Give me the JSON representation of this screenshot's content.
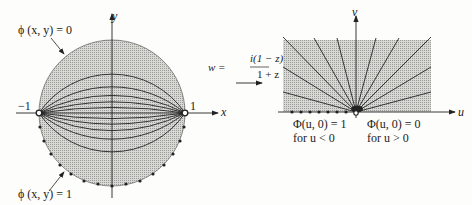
{
  "left_panel": {
    "label_top": "ϕ (x, y) = 0",
    "label_bottom": "ϕ (x, y) = 1",
    "axis_x": "x",
    "axis_y": "y",
    "point_left": "−1",
    "point_right": "1"
  },
  "mapping": {
    "lhs": "w =",
    "numerator": "i(1 − z)",
    "denominator": "1 + z"
  },
  "right_panel": {
    "axis_x": "u",
    "axis_y": "v",
    "left_condition_line1": "Φ(u, 0) = 1",
    "left_condition_line2": "for u < 0",
    "right_condition_line1": "Φ(u, 0) = 0",
    "right_condition_line2": "for u > 0"
  },
  "colors": {
    "shade": "#c9c9c6",
    "line": "#222222",
    "background": "#fdfdfb"
  }
}
